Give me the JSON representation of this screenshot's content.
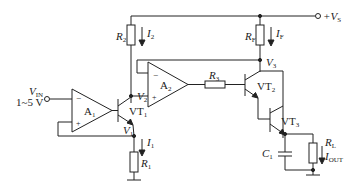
{
  "diagram": {
    "type": "circuit-schematic",
    "title": "",
    "supply": {
      "label": "+V",
      "sub": "S"
    },
    "input": {
      "label": "V",
      "sub": "IN",
      "range": "1~5 V"
    },
    "opamps": [
      {
        "id": "A1",
        "label": "A",
        "sub": "1",
        "minus": "−",
        "plus": "+"
      },
      {
        "id": "A2",
        "label": "A",
        "sub": "2",
        "minus": "−",
        "plus": "+"
      }
    ],
    "transistors": [
      {
        "id": "VT1",
        "label": "VT",
        "sub": "1"
      },
      {
        "id": "VT2",
        "label": "VT",
        "sub": "2"
      },
      {
        "id": "VT3",
        "label": "VT",
        "sub": "3"
      }
    ],
    "resistors": [
      {
        "id": "R1",
        "label": "R",
        "sub": "1"
      },
      {
        "id": "R2",
        "label": "R",
        "sub": "2"
      },
      {
        "id": "R3",
        "label": "R",
        "sub": "3"
      },
      {
        "id": "RF",
        "label": "R",
        "sub": "F"
      },
      {
        "id": "RL",
        "label": "R",
        "sub": "L"
      }
    ],
    "capacitors": [
      {
        "id": "C1",
        "label": "C",
        "sub": "1"
      }
    ],
    "nodes": [
      {
        "id": "V1",
        "label": "V",
        "sub": "1"
      },
      {
        "id": "V2",
        "label": "V",
        "sub": "2"
      },
      {
        "id": "V3",
        "label": "V",
        "sub": "3"
      }
    ],
    "currents": [
      {
        "id": "I1",
        "label": "I",
        "sub": "1"
      },
      {
        "id": "I2",
        "label": "I",
        "sub": "2"
      },
      {
        "id": "IF",
        "label": "I",
        "sub": "F"
      },
      {
        "id": "IOUT",
        "label": "I",
        "sub": "OUT"
      }
    ]
  }
}
